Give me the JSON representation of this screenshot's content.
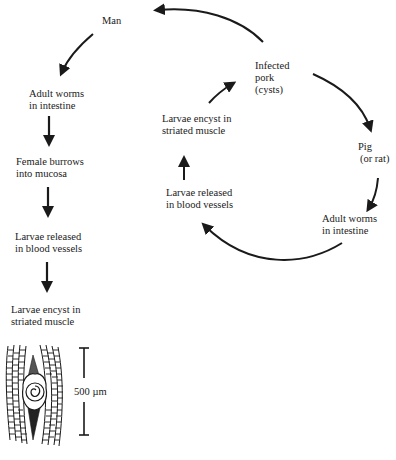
{
  "diagram": {
    "cycle": {
      "infected_pork": {
        "line1": "Infected",
        "line2": "pork",
        "line3": "(cysts)"
      },
      "pig": {
        "line1": "Pig",
        "line2": "(or rat)"
      },
      "adult_worms": {
        "line1": "Adult worms",
        "line2": "in intestine"
      },
      "larvae_released": {
        "line1": "Larvae released",
        "line2": "in blood vessels"
      },
      "larvae_encyst": {
        "line1": "Larvae encyst in",
        "line2": "striated muscle"
      }
    },
    "human": {
      "man": "Man",
      "adult_worms": {
        "line1": "Adult worms",
        "line2": "in intestine"
      },
      "female_burrows": {
        "line1": "Female burrows",
        "line2": "into mucosa"
      },
      "larvae_released": {
        "line1": "Larvae released",
        "line2": "in blood vessels"
      },
      "larvae_encyst": {
        "line1": "Larvae encyst in",
        "line2": "striated muscle"
      }
    },
    "scale_bar": {
      "label": "500 µm"
    },
    "colors": {
      "ink": "#1a1a1a",
      "background": "#ffffff"
    }
  }
}
